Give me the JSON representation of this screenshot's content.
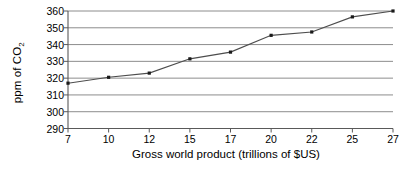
{
  "chart_data": {
    "type": "line",
    "title": "",
    "subtitle": "",
    "xlabel": "Gross world product (trillions of $US)",
    "ylabel": "ppm of CO2",
    "ylabel_html": "ppm of CO₂",
    "categories": [
      "7",
      "10",
      "12",
      "15",
      "17",
      "20",
      "22",
      "25",
      "27"
    ],
    "x": [
      7,
      10,
      12,
      15,
      17,
      20,
      22,
      25,
      27
    ],
    "values": [
      317,
      320.5,
      323,
      331.5,
      335.5,
      345.5,
      347.5,
      356.5,
      360
    ],
    "series": [
      {
        "name": "CO2 concentration",
        "values": [
          317,
          320.5,
          323,
          331.5,
          335.5,
          345.5,
          347.5,
          356.5,
          360
        ]
      }
    ],
    "ylim": [
      290,
      360
    ],
    "ytick_step": 10,
    "yticks": [
      290,
      300,
      310,
      320,
      330,
      340,
      350,
      360
    ],
    "xticks": [
      "7",
      "10",
      "12",
      "15",
      "17",
      "20",
      "22",
      "25",
      "27"
    ],
    "x_axis_scale": "categorical-evenly-spaced",
    "grid": {
      "horizontal": true,
      "vertical": false
    },
    "legend": {
      "visible": false,
      "position": "none"
    },
    "marker": "square",
    "line_color": "#4d4d4d",
    "marker_color": "#1a1a1a",
    "grid_color": "#808080",
    "axis_color": "#595959",
    "background_color": "#ffffff"
  }
}
